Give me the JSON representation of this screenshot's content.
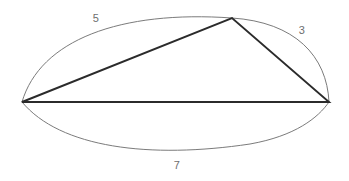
{
  "figure": {
    "background_color": "#ffffff",
    "width": 349,
    "height": 181
  },
  "style": {
    "arc_color": "#7b7b7b",
    "arc_stroke_width": 1,
    "triangle_color": "#2b2b2b",
    "triangle_stroke_width": 1.9,
    "label_color": "#6e6e6e",
    "label_font_size": 11
  },
  "vertices": {
    "left": {
      "name": "left-vertex",
      "x": 22,
      "y": 102
    },
    "top": {
      "name": "apex-vertex",
      "x": 232,
      "y": 18
    },
    "right": {
      "name": "right-vertex",
      "x": 329,
      "y": 102
    }
  },
  "triangle": {
    "name": "inscribed-triangle",
    "path": "M 22 102 L 232 18 L 329 102 Z",
    "edges": [
      {
        "name": "edge-left-to-apex",
        "from": "left",
        "to": "top"
      },
      {
        "name": "edge-apex-to-right",
        "from": "top",
        "to": "right"
      },
      {
        "name": "edge-base",
        "from": "left",
        "to": "right"
      }
    ]
  },
  "arcs": [
    {
      "name": "arc-5",
      "label": "5",
      "from": "left",
      "to": "top",
      "bulge": "outward-upper-left",
      "path": "M 22 102 C 40 40 120 10 232 18"
    },
    {
      "name": "arc-3",
      "label": "3",
      "from": "top",
      "to": "right",
      "bulge": "outward-upper-right",
      "path": "M 232 18 C 295 22 327 56 329 102"
    },
    {
      "name": "arc-7",
      "label": "7",
      "from": "left",
      "to": "right",
      "bulge": "outward-lower",
      "path": "M 22 102 C 60 148 150 159 250 144 C 295 136 318 118 329 102"
    }
  ],
  "labels": [
    {
      "name": "arc-label-5",
      "text": "5",
      "x": 96,
      "y": 18
    },
    {
      "name": "arc-label-3",
      "text": "3",
      "x": 302,
      "y": 30
    },
    {
      "name": "arc-label-7",
      "text": "7",
      "x": 177,
      "y": 165
    }
  ]
}
